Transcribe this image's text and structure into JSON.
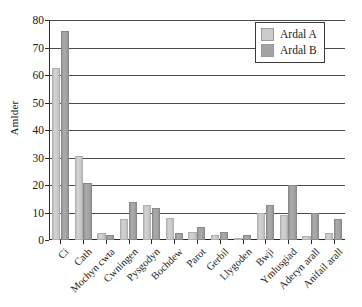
{
  "chart_data": {
    "type": "bar",
    "title": "",
    "xlabel": "",
    "ylabel": "Amlder",
    "ylim": [
      0,
      80
    ],
    "ytick_step": 10,
    "yticks": [
      0,
      10,
      20,
      30,
      40,
      50,
      60,
      70,
      80
    ],
    "grid": "horizontal",
    "legend_position": "top-right",
    "categories": [
      "Ci",
      "Cath",
      "Mochyn cwta",
      "Cwningen",
      "Pysgodyn",
      "Bochdew",
      "Parot",
      "Gerbil",
      "Llygoden",
      "Bwji",
      "Ymlusgiad",
      "Aderyn arall",
      "Anifail arall"
    ],
    "series": [
      {
        "name": "Ardal A",
        "color": "#cbcbcb",
        "values": [
          62.5,
          30.5,
          2.5,
          7.6,
          12.8,
          8.0,
          3.0,
          1.7,
          0.7,
          10.0,
          9.0,
          1.5,
          2.7
        ]
      },
      {
        "name": "Ardal B",
        "color": "#a3a3a3",
        "values": [
          76.0,
          20.7,
          1.8,
          13.8,
          11.6,
          2.6,
          4.9,
          2.8,
          1.8,
          12.9,
          20.0,
          10.0,
          7.6
        ]
      }
    ]
  },
  "legend": {
    "entries": [
      {
        "label": "Ardal A"
      },
      {
        "label": "Ardal B"
      }
    ]
  }
}
